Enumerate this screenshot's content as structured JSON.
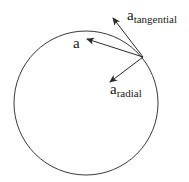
{
  "diagram": {
    "type": "circular-motion-acceleration",
    "colors": {
      "stroke": "#3a3a3a",
      "arrow": "#2a2a2a",
      "text": "#1a1a1a",
      "background": "#ffffff"
    },
    "circle": {
      "cx": 86,
      "cy": 103,
      "r": 72
    },
    "origin": {
      "x": 143,
      "y": 57
    },
    "vectors": [
      {
        "id": "a",
        "tip": {
          "x": 87,
          "y": 39
        }
      },
      {
        "id": "a_tangential",
        "tip": {
          "x": 113,
          "y": 18
        }
      },
      {
        "id": "a_radial",
        "tip": {
          "x": 110,
          "y": 82
        }
      }
    ],
    "labels": {
      "a": {
        "base": "a",
        "sub": ""
      },
      "a_tangential": {
        "base": "a",
        "sub": "tangential"
      },
      "a_radial": {
        "base": "a",
        "sub": "radial"
      }
    }
  }
}
